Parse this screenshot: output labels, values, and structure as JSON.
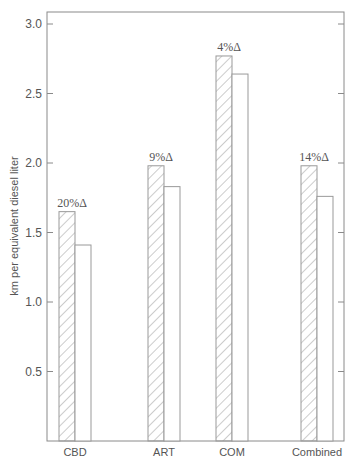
{
  "chart_data": {
    "type": "bar",
    "title": "",
    "xlabel": "",
    "ylabel": "km per equivalent diesel liter",
    "ylim": [
      0,
      3.1
    ],
    "yticks": [
      0.5,
      1.0,
      1.5,
      2.0,
      2.5,
      3.0
    ],
    "ytick_labels": [
      "0.5",
      "1.0",
      "1.5",
      "2.0",
      "2.5",
      "3.0"
    ],
    "grid": false,
    "legend": null,
    "categories": [
      "CBD",
      "ART",
      "COM",
      "Combined"
    ],
    "series": [
      {
        "name": "hatched",
        "pattern": "diagonal-hatch",
        "values": [
          1.65,
          1.98,
          2.77,
          1.98
        ]
      },
      {
        "name": "plain",
        "pattern": "none",
        "values": [
          1.41,
          1.83,
          2.64,
          1.76
        ]
      }
    ],
    "annotations": [
      "20%Δ",
      "9%Δ",
      "4%Δ",
      "14%Δ"
    ]
  },
  "colors": {
    "axis": "#888888",
    "bar_stroke": "#999999",
    "text": "#555555",
    "background": "#ffffff"
  }
}
